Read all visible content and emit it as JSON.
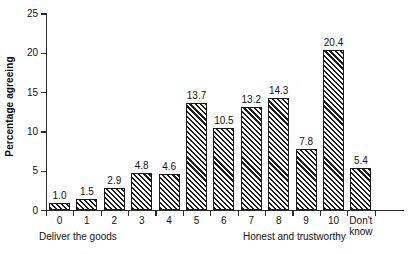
{
  "chart_data": {
    "type": "bar",
    "title": "",
    "subtitle": "",
    "xlabel": "",
    "ylabel": "Percentage agreeing",
    "categories": [
      "0",
      "1",
      "2",
      "3",
      "4",
      "5",
      "6",
      "7",
      "8",
      "9",
      "10",
      "Don't know"
    ],
    "values": [
      1.0,
      1.5,
      2.9,
      4.8,
      4.6,
      13.7,
      10.5,
      13.2,
      14.3,
      7.8,
      20.4,
      5.4
    ],
    "data_labels": [
      "1.0",
      "1.5",
      "2.9",
      "4.8",
      "4.6",
      "13.7",
      "10.5",
      "13.2",
      "14.3",
      "7.8",
      "20.4",
      "5.4"
    ],
    "ylim": [
      0,
      25
    ],
    "ytick_values": [
      0,
      5,
      10,
      15,
      20,
      25
    ],
    "ytick_labels": [
      "0",
      "5",
      "10",
      "15",
      "20",
      "25"
    ],
    "grid": false,
    "legend": false,
    "legend_position": "none",
    "bar_fill": "diagonal-hatch",
    "bar_color": "#1c1c1c",
    "background_color": "#ffffff",
    "axis_color": "#2b2b2b",
    "annotations": [
      {
        "name": "left-anchor",
        "text": "Deliver the goods"
      },
      {
        "name": "right-anchor",
        "text": "Honest and trustworthy"
      }
    ]
  },
  "axis": {
    "y_title": "Percentage agreeing"
  },
  "anchors": {
    "left": "Deliver the goods",
    "right": "Honest and trustworthy"
  },
  "x_labels": [
    {
      "line1": "0",
      "line2": ""
    },
    {
      "line1": "1",
      "line2": ""
    },
    {
      "line1": "2",
      "line2": ""
    },
    {
      "line1": "3",
      "line2": ""
    },
    {
      "line1": "4",
      "line2": ""
    },
    {
      "line1": "5",
      "line2": ""
    },
    {
      "line1": "6",
      "line2": ""
    },
    {
      "line1": "7",
      "line2": ""
    },
    {
      "line1": "8",
      "line2": ""
    },
    {
      "line1": "9",
      "line2": ""
    },
    {
      "line1": "10",
      "line2": ""
    },
    {
      "line1": "Don't",
      "line2": "know"
    }
  ]
}
